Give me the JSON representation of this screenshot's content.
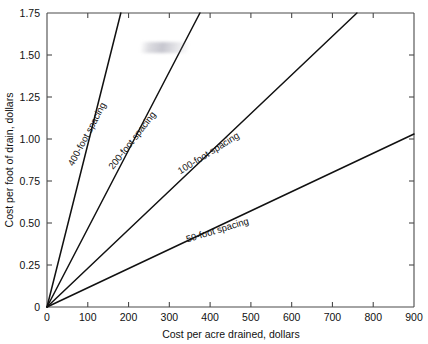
{
  "chart_data": {
    "type": "line",
    "title": "",
    "subtitle": "",
    "xlabel": "Cost per acre drained, dollars",
    "ylabel": "Cost per foot of drain, dollars",
    "xlim": [
      0,
      900
    ],
    "ylim": [
      0,
      1.75
    ],
    "xticks": [
      0,
      100,
      200,
      300,
      400,
      500,
      600,
      700,
      800,
      900
    ],
    "xtick_labels": [
      "0",
      "100",
      "200",
      "300",
      "400",
      "500",
      "600",
      "700",
      "800",
      "900"
    ],
    "yticks": [
      0,
      0.25,
      0.5,
      0.75,
      1.0,
      1.25,
      1.5,
      1.75
    ],
    "ytick_labels": [
      "0",
      "0.25",
      "0.50",
      "0.75",
      "1.00",
      "1.25",
      "1.50",
      "1.75"
    ],
    "grid": false,
    "legend_position": "inline-on-line",
    "line_color": "#111111",
    "axis_color": "#4a4a4a",
    "series": [
      {
        "name": "400-foot spacing",
        "label": "400-foot spacing",
        "slope": 0.00966,
        "x": [
          0,
          181
        ],
        "y": [
          0,
          1.75
        ],
        "label_x": 105,
        "label_y": 1.02,
        "label_angle": -62
      },
      {
        "name": "200-foot spacing",
        "label": "200-foot spacing",
        "slope": 0.004667,
        "x": [
          0,
          375
        ],
        "y": [
          0,
          1.75
        ],
        "label_x": 215,
        "label_y": 0.98,
        "label_angle": -52
      },
      {
        "name": "100-foot spacing",
        "label": "100-foot spacing",
        "slope": 0.002302,
        "x": [
          0,
          760
        ],
        "y": [
          0,
          1.75
        ],
        "label_x": 400,
        "label_y": 0.9,
        "label_angle": -32
      },
      {
        "name": "50-foot spacing",
        "label": "50-foot spacing",
        "slope": 0.001144,
        "x": [
          0,
          900
        ],
        "y": [
          0,
          1.03
        ],
        "label_x": 420,
        "label_y": 0.44,
        "label_angle": -17
      }
    ],
    "annotations": [
      {
        "name": "faded-smudge",
        "text": ""
      }
    ]
  }
}
